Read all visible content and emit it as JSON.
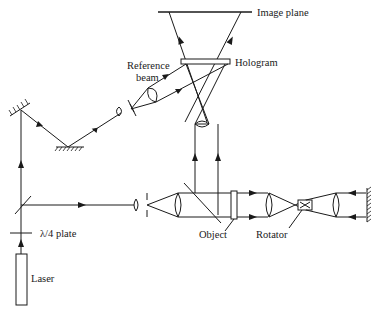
{
  "diagram": {
    "labels": {
      "image_plane": "Image plane",
      "hologram": "Hologram",
      "reference_beam_1": "Reference",
      "reference_beam_2": "beam",
      "lambda_plate": "λ/4 plate",
      "laser": "Laser",
      "object": "Object",
      "rotator": "Rotator"
    },
    "components": [
      "laser",
      "lambda-4-plate",
      "beam-splitter",
      "mirror-top-left",
      "mirror-bottom",
      "reference-lens",
      "reference-pinhole",
      "reference-collimator",
      "hologram",
      "image-plane",
      "imaging-lens",
      "object-lens",
      "object-pinhole",
      "object-collimator",
      "object-beam-splitter",
      "object",
      "relay-lens-1",
      "rotator",
      "relay-lens-2",
      "end-mirror"
    ],
    "colors": {
      "ink": "#1a1a1a",
      "background": "#ffffff"
    }
  }
}
